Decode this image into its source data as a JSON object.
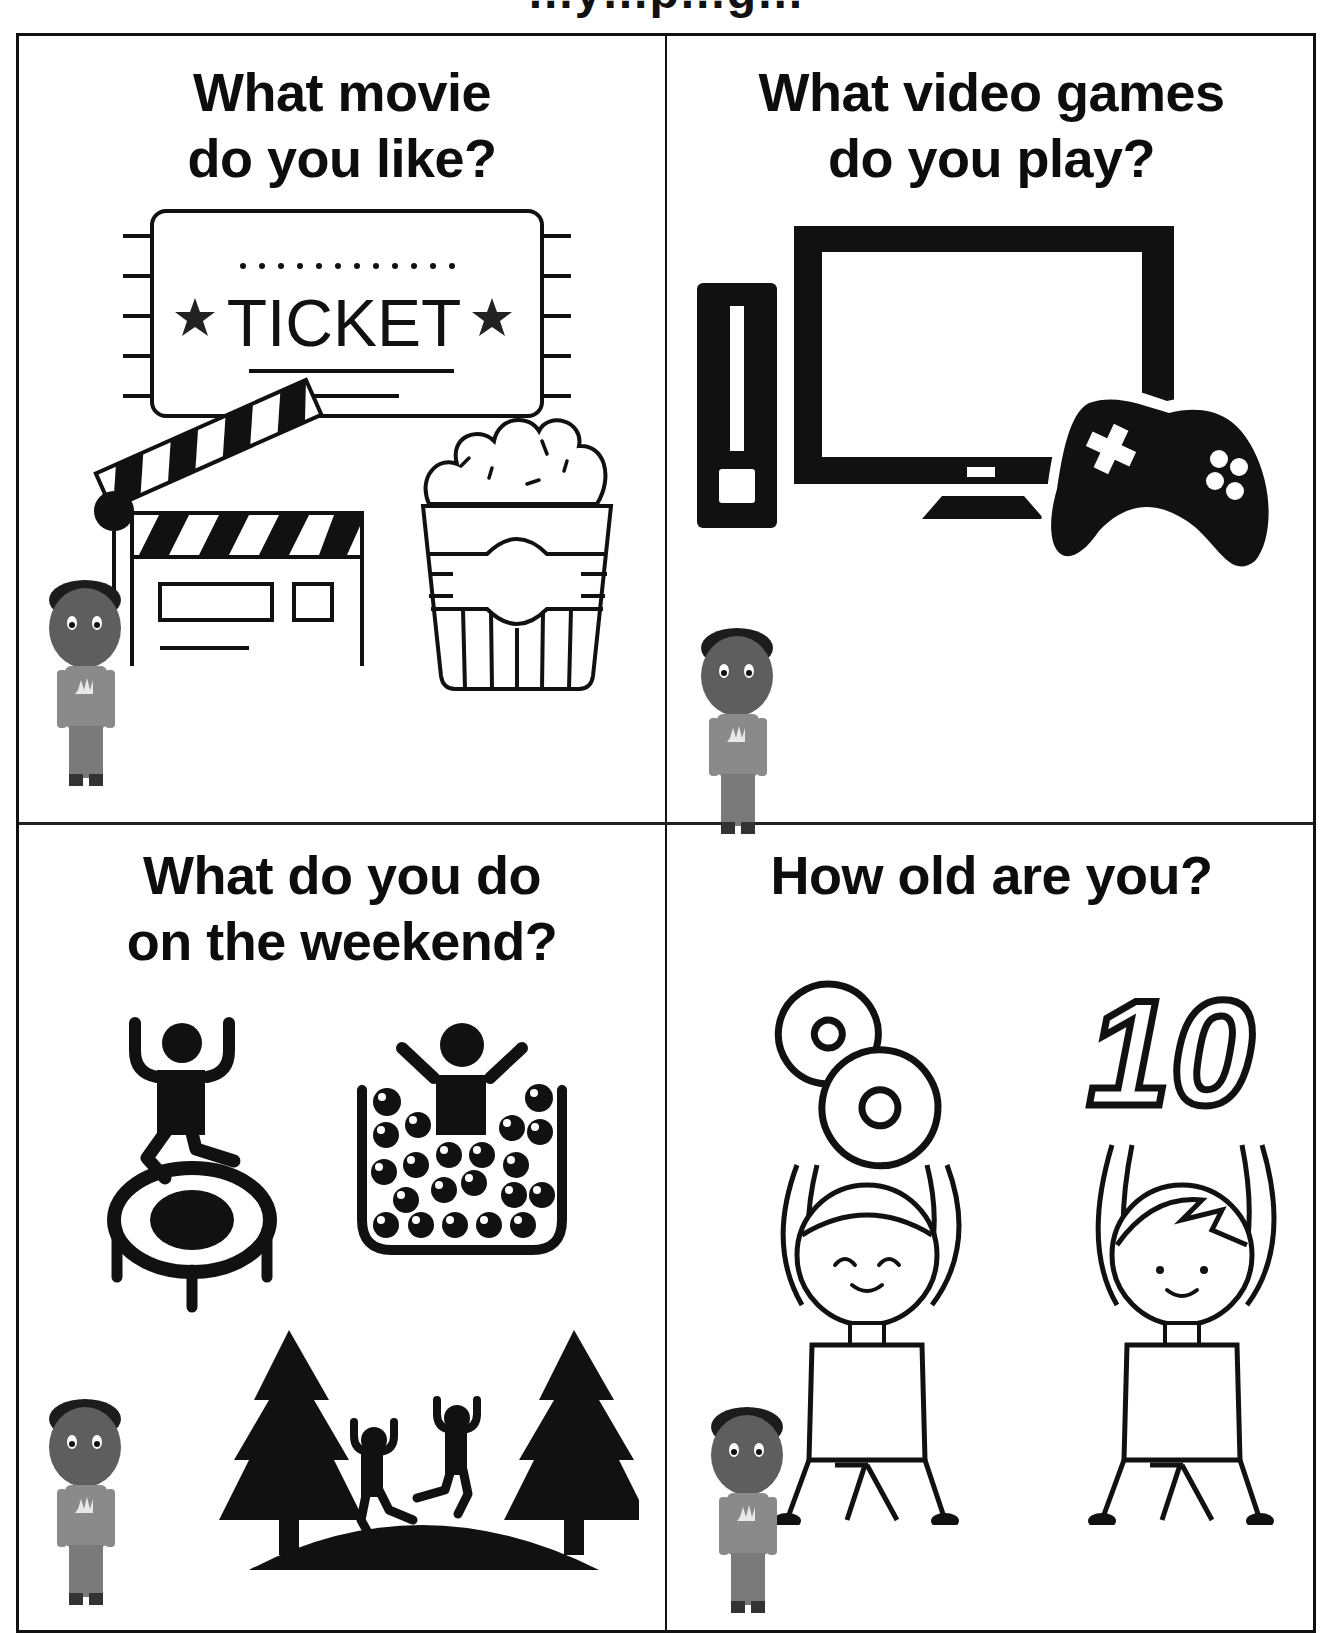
{
  "page": {
    "header_fragment": "…y…p…g…",
    "layout": "2x2 grid of question cards"
  },
  "cards": [
    {
      "id": "movie",
      "title_line1": "What movie",
      "title_line2": "do you like?",
      "illustrations": [
        "movie-ticket-icon",
        "clapperboard-icon",
        "popcorn-icon",
        "boy-avatar"
      ],
      "ticket_text": "TICKET"
    },
    {
      "id": "video-games",
      "title_line1": "What video games",
      "title_line2": "do you play?",
      "illustrations": [
        "game-console-icon",
        "monitor-icon",
        "gamepad-icon",
        "boy-avatar"
      ]
    },
    {
      "id": "weekend",
      "title_line1": "What do you do",
      "title_line2": "on the weekend?",
      "illustrations": [
        "trampoline-icon",
        "ball-pit-icon",
        "park-trees-icon",
        "boy-avatar"
      ]
    },
    {
      "id": "age",
      "title_line1": "How old are you?",
      "title_line2": "",
      "illustrations": [
        "girl-holding-number-icon",
        "boy-holding-number-icon",
        "boy-avatar"
      ],
      "numbers": [
        "8",
        "10"
      ]
    }
  ],
  "colors": {
    "ink": "#111111",
    "background": "#ffffff",
    "avatar_skin": "#5e5e5e",
    "avatar_shirt": "#8a8a8a",
    "avatar_hair": "#1c1c1c"
  }
}
